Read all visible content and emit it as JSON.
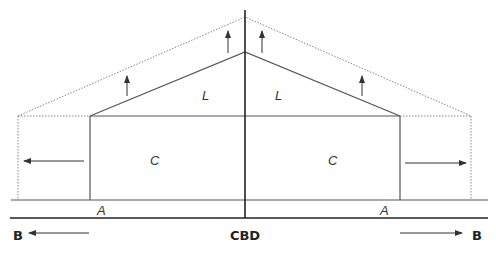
{
  "diagram": {
    "labels": {
      "l_left": "L",
      "l_right": "L",
      "c_left": "C",
      "c_right": "C",
      "a_left": "A",
      "a_right": "A",
      "cbd": "CBD",
      "b_left": "B",
      "b_right": "B"
    },
    "colors": {
      "solid_line": "#555555",
      "dotted_line": "#888888",
      "axis_line": "#222222",
      "arrow": "#333333"
    }
  }
}
